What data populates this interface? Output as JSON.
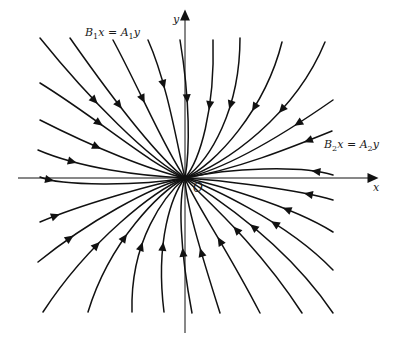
{
  "diagram": {
    "type": "phase-portrait",
    "colors": {
      "stroke": "#111111",
      "background": "#ffffff"
    },
    "origin": {
      "x": 185,
      "y": 178
    },
    "labels": {
      "y_axis": "y",
      "x_axis": "x",
      "origin": "O",
      "eigenline_1": {
        "lhs_var": "B",
        "lhs_sub": "1",
        "lhs_x": "x",
        "eq": " = ",
        "rhs_var": "A",
        "rhs_sub": "1",
        "rhs_y": "y",
        "text": "B1x = A1y"
      },
      "eigenline_2": {
        "lhs_var": "B",
        "lhs_sub": "2",
        "lhs_x": "x",
        "eq": " = ",
        "rhs_var": "A",
        "rhs_sub": "2",
        "rhs_y": "y",
        "text": "B2x = A2y"
      }
    },
    "axes": {
      "x": {
        "from": [
          18,
          178
        ],
        "to": [
          378,
          178
        ],
        "arrow": "right"
      },
      "y": {
        "from": [
          185,
          333
        ],
        "to": [
          185,
          10
        ],
        "arrow": "up"
      }
    },
    "trajectories": [
      {
        "q": "top-left",
        "start": [
          40,
          38
        ],
        "c1": [
          90,
          100
        ],
        "c2": [
          150,
          160
        ],
        "arrow_t": 0.35
      },
      {
        "q": "top-left",
        "start": [
          70,
          38
        ],
        "c1": [
          110,
          95
        ],
        "c2": [
          155,
          155
        ],
        "arrow_t": 0.4
      },
      {
        "q": "top-left",
        "start": [
          113,
          40
        ],
        "c1": [
          140,
          90
        ],
        "c2": [
          165,
          150
        ],
        "arrow_t": 0.38
      },
      {
        "q": "top-left",
        "start": [
          148,
          40
        ],
        "c1": [
          168,
          85
        ],
        "c2": [
          178,
          150
        ],
        "arrow_t": 0.3
      },
      {
        "q": "top-left",
        "start": [
          40,
          83
        ],
        "c1": [
          100,
          120
        ],
        "c2": [
          150,
          165
        ],
        "arrow_t": 0.35
      },
      {
        "q": "top-left",
        "start": [
          40,
          120
        ],
        "c1": [
          95,
          148
        ],
        "c2": [
          150,
          170
        ],
        "arrow_t": 0.35
      },
      {
        "q": "top-left",
        "start": [
          38,
          150
        ],
        "c1": [
          80,
          168
        ],
        "c2": [
          140,
          176
        ],
        "arrow_t": 0.25
      },
      {
        "q": "left-axis",
        "start": [
          40,
          177
        ],
        "c1": [
          60,
          186
        ],
        "c2": [
          140,
          186
        ],
        "arrow_t": 0.12
      },
      {
        "q": "top-right",
        "start": [
          180,
          40
        ],
        "c1": [
          190,
          100
        ],
        "c2": [
          190,
          150
        ],
        "arrow_t": 0.35
      },
      {
        "q": "top-right",
        "start": [
          213,
          40
        ],
        "c1": [
          215,
          110
        ],
        "c2": [
          200,
          160
        ],
        "arrow_t": 0.35
      },
      {
        "q": "top-right",
        "start": [
          240,
          38
        ],
        "c1": [
          240,
          110
        ],
        "c2": [
          210,
          160
        ],
        "arrow_t": 0.35
      },
      {
        "q": "top-right",
        "start": [
          282,
          42
        ],
        "c1": [
          265,
          110
        ],
        "c2": [
          215,
          165
        ],
        "arrow_t": 0.35
      },
      {
        "q": "top-right",
        "start": [
          325,
          42
        ],
        "c1": [
          295,
          115
        ],
        "c2": [
          225,
          165
        ],
        "arrow_t": 0.35
      },
      {
        "q": "top-right",
        "start": [
          333,
          100
        ],
        "c1": [
          290,
          130
        ],
        "c2": [
          230,
          168
        ],
        "arrow_t": 0.25
      },
      {
        "q": "top-right",
        "start": [
          332,
          131
        ],
        "c1": [
          290,
          148
        ],
        "c2": [
          235,
          170
        ],
        "arrow_t": 0.18
      },
      {
        "q": "top-right",
        "start": [
          333,
          175
        ],
        "c1": [
          300,
          165
        ],
        "c2": [
          230,
          168
        ],
        "arrow_t": 0.15
      },
      {
        "q": "bottom-left",
        "start": [
          40,
          222
        ],
        "c1": [
          80,
          205
        ],
        "c2": [
          150,
          185
        ],
        "arrow_t": 0.12
      },
      {
        "q": "bottom-left",
        "start": [
          38,
          262
        ],
        "c1": [
          90,
          220
        ],
        "c2": [
          150,
          188
        ],
        "arrow_t": 0.2
      },
      {
        "q": "bottom-left",
        "start": [
          43,
          312
        ],
        "c1": [
          90,
          240
        ],
        "c2": [
          155,
          190
        ],
        "arrow_t": 0.35
      },
      {
        "q": "bottom-left",
        "start": [
          88,
          312
        ],
        "c1": [
          110,
          240
        ],
        "c2": [
          160,
          192
        ],
        "arrow_t": 0.4
      },
      {
        "q": "bottom-left",
        "start": [
          132,
          312
        ],
        "c1": [
          130,
          240
        ],
        "c2": [
          165,
          195
        ],
        "arrow_t": 0.35
      },
      {
        "q": "bottom-left",
        "start": [
          164,
          312
        ],
        "c1": [
          155,
          240
        ],
        "c2": [
          172,
          195
        ],
        "arrow_t": 0.35
      },
      {
        "q": "bottom-left",
        "start": [
          192,
          313
        ],
        "c1": [
          180,
          250
        ],
        "c2": [
          178,
          200
        ],
        "arrow_t": 0.35
      },
      {
        "q": "bottom-right",
        "start": [
          220,
          313
        ],
        "c1": [
          200,
          250
        ],
        "c2": [
          185,
          200
        ],
        "arrow_t": 0.35
      },
      {
        "q": "bottom-right",
        "start": [
          260,
          313
        ],
        "c1": [
          225,
          245
        ],
        "c2": [
          190,
          195
        ],
        "arrow_t": 0.4
      },
      {
        "q": "bottom-right",
        "start": [
          302,
          313
        ],
        "c1": [
          255,
          240
        ],
        "c2": [
          195,
          190
        ],
        "arrow_t": 0.45
      },
      {
        "q": "bottom-right",
        "start": [
          333,
          313
        ],
        "c1": [
          280,
          235
        ],
        "c2": [
          200,
          188
        ],
        "arrow_t": 0.45
      },
      {
        "q": "bottom-right",
        "start": [
          333,
          270
        ],
        "c1": [
          285,
          220
        ],
        "c2": [
          205,
          185
        ],
        "arrow_t": 0.35
      },
      {
        "q": "bottom-right",
        "start": [
          333,
          232
        ],
        "c1": [
          290,
          205
        ],
        "c2": [
          210,
          183
        ],
        "arrow_t": 0.3
      },
      {
        "q": "bottom-right",
        "start": [
          333,
          200
        ],
        "c1": [
          300,
          190
        ],
        "c2": [
          220,
          180
        ],
        "arrow_t": 0.2
      }
    ]
  }
}
